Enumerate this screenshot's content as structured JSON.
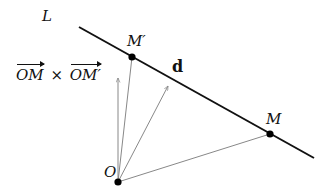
{
  "diagram": {
    "title": "",
    "labels": {
      "line": "L",
      "point_m_prime": "M′",
      "point_m": "M",
      "origin": "O",
      "direction_vector": "d",
      "cross_product": {
        "left": "OM",
        "operator": "×",
        "right": "OM′"
      }
    },
    "points": {
      "O": [
        118,
        182
      ],
      "M": [
        270,
        134
      ],
      "M_prime": [
        132,
        57
      ]
    },
    "line_L": {
      "from": [
        79,
        27
      ],
      "to": [
        314,
        158
      ]
    },
    "vectors": [
      {
        "name": "OM",
        "from": [
          118,
          182
        ],
        "to": [
          270,
          134
        ]
      },
      {
        "name": "OM_prime",
        "from": [
          118,
          182
        ],
        "to": [
          132,
          57
        ]
      },
      {
        "name": "d",
        "from": [
          118,
          182
        ],
        "to": [
          168,
          86
        ]
      },
      {
        "name": "cross_product",
        "from": [
          118,
          182
        ],
        "to": [
          118,
          78
        ]
      }
    ],
    "colors": {
      "line": "#111111",
      "vectors": "#888888",
      "points": "#000000",
      "text": "#111111"
    }
  }
}
